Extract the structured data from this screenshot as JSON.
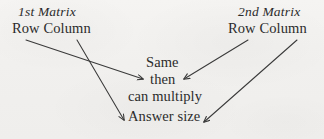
{
  "diagram": {
    "title_first_matrix": "1st Matrix",
    "title_second_matrix": "2nd Matrix",
    "first_matrix_dims": "Row Column",
    "second_matrix_dims": "Row Column",
    "center_line_1": "Same",
    "center_line_2": "then",
    "center_line_3": "can multiply",
    "result_label": "Answer size",
    "colors": {
      "background": "#f2f1ef",
      "ink": "#2b2b2b",
      "stroke": "#3a3a3a"
    },
    "arrows": [
      {
        "name": "first-column-to-then",
        "from_label": "1st Matrix Column",
        "to_label": "then",
        "x1": 26,
        "y1": 40,
        "x2": 143,
        "y2": 79
      },
      {
        "name": "first-row-to-answer-size",
        "from_label": "1st Matrix Row",
        "to_label": "Answer size",
        "x1": 77,
        "y1": 40,
        "x2": 124,
        "y2": 120
      },
      {
        "name": "second-row-to-then",
        "from_label": "2nd Matrix Row",
        "to_label": "then",
        "x1": 248,
        "y1": 40,
        "x2": 184,
        "y2": 79
      },
      {
        "name": "second-column-to-answer-size",
        "from_label": "2nd Matrix Column",
        "to_label": "Answer size",
        "x1": 297,
        "y1": 40,
        "x2": 204,
        "y2": 122
      }
    ]
  }
}
